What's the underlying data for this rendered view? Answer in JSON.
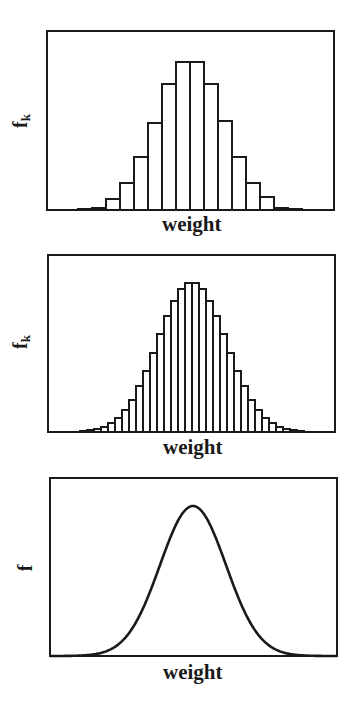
{
  "figure": {
    "background": "#ffffff",
    "ink_color": "#1a1a1a"
  },
  "chart_data": [
    {
      "type": "bar",
      "title": "",
      "xlabel": "weight",
      "ylabel": "f",
      "ylabel_subscript": "k",
      "grid": false,
      "legend": null,
      "ticks": "none",
      "description": "Histogram of weights with wide bins (frequency f_k per bin)",
      "bin_width_px": 14,
      "center_px": 190,
      "values": [
        1,
        2,
        11,
        27,
        53,
        87,
        126,
        148,
        148,
        126,
        89,
        53,
        27,
        13,
        2,
        1
      ],
      "ylim": [
        0,
        179
      ]
    },
    {
      "type": "bar",
      "title": "",
      "xlabel": "weight",
      "ylabel": "f",
      "ylabel_subscript": "k",
      "grid": false,
      "legend": null,
      "ticks": "none",
      "description": "Histogram of weights with narrow bins (frequency f_k per bin)",
      "bin_width_px": 7,
      "center_px": 192,
      "values": [
        1,
        2,
        3,
        5,
        9,
        14,
        22,
        32,
        46,
        61,
        79,
        98,
        116,
        131,
        143,
        149,
        149,
        143,
        131,
        116,
        98,
        79,
        61,
        46,
        32,
        22,
        14,
        9,
        5,
        3,
        2,
        1
      ],
      "ylim": [
        0,
        177
      ]
    },
    {
      "type": "line",
      "title": "",
      "xlabel": "weight",
      "ylabel": "f",
      "grid": false,
      "legend": null,
      "ticks": "none",
      "description": "Continuous bell-shaped (normal) frequency curve, limit of infinitely narrow bins",
      "curve": "gaussian",
      "center_px": 193,
      "sigma_px": 33,
      "peak": 150,
      "ylim": [
        0,
        178
      ]
    }
  ],
  "panels": [
    {
      "ylabel": "f",
      "ylabel_sub": "k",
      "xlabel": "weight"
    },
    {
      "ylabel": "f",
      "ylabel_sub": "k",
      "xlabel": "weight"
    },
    {
      "ylabel": "f",
      "ylabel_sub": "",
      "xlabel": "weight"
    }
  ]
}
